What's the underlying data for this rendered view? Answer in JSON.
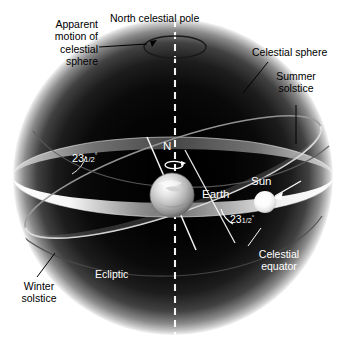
{
  "figure": {
    "background_color": "#ffffff",
    "sphere_color_edge": "#d8d8d8",
    "sphere_color_core": "#050505",
    "ring_color": "#f2f2f2",
    "line_color": "#ffffff",
    "text_color_outside": "#000000",
    "text_color_inside": "#ffffff"
  },
  "labels": {
    "apparent_motion": "Apparent\nmotion of\ncelestial\nsphere",
    "north_celestial_pole": "North celestial pole",
    "celestial_sphere": "Celestial sphere",
    "summer_solstice": "Summer\nsolstice",
    "winter_solstice": "Winter\nsolstice",
    "ecliptic": "Ecliptic",
    "celestial_equator": "Celestial\nequator",
    "earth": "Earth",
    "sun": "Sun",
    "north_axis": "N",
    "tilt_left": "23",
    "tilt_left_frac": "1/2",
    "tilt_left_deg": "°",
    "tilt_right": "23",
    "tilt_right_frac": "1/2",
    "tilt_right_deg": "°"
  },
  "values": {
    "axial_tilt_degrees": "23.5",
    "sphere_center_x": 173,
    "sphere_center_y": 177,
    "sphere_radius_x": 160,
    "sphere_radius_y": 158,
    "earth_radius": 22,
    "sun_radius": 11
  },
  "icons": {
    "rotation_arrow": "earth-rotation-arrow",
    "pole_motion_arrow": "apparent-motion-arrow",
    "sun_pointer_arrow": "sun-pointer-arrow"
  }
}
